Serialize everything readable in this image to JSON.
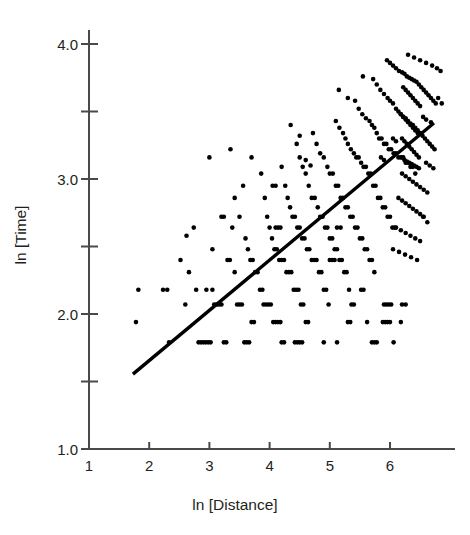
{
  "figure": {
    "background_color": "#ffffff",
    "ink_color": "#231f20",
    "point_color": "#000000",
    "line_color": "#000000"
  },
  "chart_data": {
    "type": "scatter",
    "title": "",
    "xlabel": "ln [Distance]",
    "ylabel": "ln [Time]",
    "xlim": [
      1.0,
      6.95
    ],
    "ylim": [
      1.0,
      4.05
    ],
    "xticks": [
      1,
      2,
      3,
      4,
      5,
      6
    ],
    "xtick_labels": [
      "1",
      "2",
      "3",
      "4",
      "5",
      "6"
    ],
    "yticks": [
      1.0,
      1.5,
      2.0,
      2.5,
      3.0,
      3.5,
      4.0
    ],
    "ytick_labels": [
      "1.0",
      "",
      "2.0",
      "",
      "3.0",
      "",
      "4.0"
    ],
    "ytick_minor": [
      1.5,
      2.5,
      3.5
    ],
    "grid": false,
    "legend": null,
    "marker": "circle",
    "marker_size_px": 4.6,
    "trendline": {
      "label": "",
      "x": [
        1.73,
        6.73
      ],
      "y": [
        1.555,
        3.415
      ],
      "slope": 0.372,
      "intercept": 0.912,
      "width_px": 3.4
    },
    "points": [
      [
        1.78,
        1.94
      ],
      [
        1.82,
        2.18
      ],
      [
        2.23,
        2.18
      ],
      [
        2.3,
        2.18
      ],
      [
        2.33,
        1.79
      ],
      [
        2.52,
        2.4
      ],
      [
        2.6,
        2.07
      ],
      [
        2.62,
        2.58
      ],
      [
        2.66,
        2.31
      ],
      [
        2.74,
        2.64
      ],
      [
        2.78,
        2.18
      ],
      [
        2.82,
        1.79
      ],
      [
        2.86,
        1.79
      ],
      [
        2.9,
        1.79
      ],
      [
        2.94,
        1.79
      ],
      [
        2.98,
        1.79
      ],
      [
        3.02,
        1.79
      ],
      [
        3.0,
        3.16
      ],
      [
        3.05,
        2.48
      ],
      [
        3.08,
        2.07
      ],
      [
        3.12,
        2.07
      ],
      [
        3.16,
        2.07
      ],
      [
        3.2,
        2.07
      ],
      [
        3.24,
        1.79
      ],
      [
        3.28,
        1.79
      ],
      [
        3.3,
        2.4
      ],
      [
        3.34,
        2.4
      ],
      [
        3.38,
        2.64
      ],
      [
        3.42,
        2.31
      ],
      [
        3.46,
        2.07
      ],
      [
        3.5,
        2.07
      ],
      [
        3.54,
        2.07
      ],
      [
        3.58,
        1.79
      ],
      [
        3.62,
        1.79
      ],
      [
        3.66,
        1.79
      ],
      [
        3.7,
        1.94
      ],
      [
        3.74,
        1.94
      ],
      [
        3.42,
        2.86
      ],
      [
        3.5,
        2.72
      ],
      [
        3.56,
        2.95
      ],
      [
        3.6,
        2.56
      ],
      [
        3.64,
        2.48
      ],
      [
        3.68,
        2.4
      ],
      [
        3.72,
        2.4
      ],
      [
        3.76,
        2.31
      ],
      [
        3.8,
        2.31
      ],
      [
        3.84,
        2.18
      ],
      [
        3.88,
        2.18
      ],
      [
        3.9,
        2.07
      ],
      [
        3.94,
        2.07
      ],
      [
        3.98,
        2.07
      ],
      [
        4.02,
        2.07
      ],
      [
        4.06,
        1.94
      ],
      [
        4.1,
        1.94
      ],
      [
        4.14,
        1.94
      ],
      [
        4.18,
        1.94
      ],
      [
        3.86,
        3.04
      ],
      [
        3.92,
        2.86
      ],
      [
        3.96,
        2.72
      ],
      [
        4.0,
        2.64
      ],
      [
        4.04,
        2.56
      ],
      [
        4.08,
        2.48
      ],
      [
        4.12,
        2.48
      ],
      [
        4.16,
        2.4
      ],
      [
        4.2,
        2.4
      ],
      [
        4.24,
        2.4
      ],
      [
        4.28,
        2.31
      ],
      [
        4.32,
        2.31
      ],
      [
        4.36,
        2.31
      ],
      [
        4.4,
        2.18
      ],
      [
        4.44,
        2.18
      ],
      [
        4.48,
        2.18
      ],
      [
        4.52,
        2.07
      ],
      [
        4.56,
        2.07
      ],
      [
        4.6,
        1.94
      ],
      [
        4.64,
        1.94
      ],
      [
        4.2,
        3.09
      ],
      [
        4.26,
        2.95
      ],
      [
        4.3,
        2.86
      ],
      [
        4.34,
        2.79
      ],
      [
        4.38,
        2.72
      ],
      [
        4.42,
        2.72
      ],
      [
        4.46,
        2.64
      ],
      [
        4.5,
        2.64
      ],
      [
        4.54,
        2.56
      ],
      [
        4.58,
        2.56
      ],
      [
        4.62,
        2.48
      ],
      [
        4.66,
        2.48
      ],
      [
        4.7,
        2.4
      ],
      [
        4.74,
        2.4
      ],
      [
        4.78,
        2.4
      ],
      [
        4.82,
        2.31
      ],
      [
        4.86,
        2.31
      ],
      [
        4.9,
        2.18
      ],
      [
        4.94,
        2.18
      ],
      [
        4.98,
        2.07
      ],
      [
        4.45,
        3.26
      ],
      [
        4.5,
        3.16
      ],
      [
        4.55,
        3.09
      ],
      [
        4.6,
        3.04
      ],
      [
        4.65,
        2.95
      ],
      [
        4.7,
        2.86
      ],
      [
        4.75,
        2.86
      ],
      [
        4.8,
        2.79
      ],
      [
        4.84,
        2.72
      ],
      [
        4.88,
        2.72
      ],
      [
        4.92,
        2.64
      ],
      [
        4.96,
        2.64
      ],
      [
        5.0,
        2.56
      ],
      [
        5.04,
        2.56
      ],
      [
        5.08,
        2.48
      ],
      [
        5.12,
        2.48
      ],
      [
        5.16,
        2.4
      ],
      [
        5.2,
        2.4
      ],
      [
        5.24,
        2.31
      ],
      [
        5.28,
        2.31
      ],
      [
        5.32,
        2.18
      ],
      [
        5.36,
        2.07
      ],
      [
        5.4,
        2.07
      ],
      [
        4.72,
        3.34
      ],
      [
        4.78,
        3.26
      ],
      [
        4.84,
        3.19
      ],
      [
        4.9,
        3.16
      ],
      [
        4.96,
        3.09
      ],
      [
        5.0,
        3.04
      ],
      [
        5.05,
        3.04
      ],
      [
        5.1,
        2.95
      ],
      [
        5.14,
        2.95
      ],
      [
        5.18,
        2.86
      ],
      [
        5.22,
        2.86
      ],
      [
        5.26,
        2.79
      ],
      [
        5.3,
        2.79
      ],
      [
        5.34,
        2.72
      ],
      [
        5.38,
        2.72
      ],
      [
        5.42,
        2.64
      ],
      [
        5.46,
        2.64
      ],
      [
        5.5,
        2.56
      ],
      [
        5.54,
        2.56
      ],
      [
        5.58,
        2.48
      ],
      [
        5.62,
        2.48
      ],
      [
        5.66,
        2.4
      ],
      [
        5.7,
        2.4
      ],
      [
        5.74,
        2.31
      ],
      [
        5.1,
        3.43
      ],
      [
        5.16,
        3.38
      ],
      [
        5.22,
        3.34
      ],
      [
        5.26,
        3.3
      ],
      [
        5.3,
        3.26
      ],
      [
        5.35,
        3.22
      ],
      [
        5.4,
        3.19
      ],
      [
        5.44,
        3.16
      ],
      [
        5.48,
        3.16
      ],
      [
        5.52,
        3.12
      ],
      [
        5.56,
        3.09
      ],
      [
        5.6,
        3.09
      ],
      [
        5.64,
        3.04
      ],
      [
        5.68,
        3.04
      ],
      [
        5.72,
        2.95
      ],
      [
        5.76,
        2.95
      ],
      [
        5.8,
        2.86
      ],
      [
        5.84,
        2.86
      ],
      [
        5.88,
        2.79
      ],
      [
        5.92,
        2.79
      ],
      [
        5.96,
        2.72
      ],
      [
        6.0,
        2.72
      ],
      [
        6.04,
        2.64
      ],
      [
        6.08,
        2.64
      ],
      [
        5.42,
        3.58
      ],
      [
        5.48,
        3.52
      ],
      [
        5.54,
        3.48
      ],
      [
        5.6,
        3.45
      ],
      [
        5.66,
        3.43
      ],
      [
        5.7,
        3.4
      ],
      [
        5.74,
        3.38
      ],
      [
        5.78,
        3.34
      ],
      [
        5.82,
        3.3
      ],
      [
        5.86,
        3.3
      ],
      [
        5.9,
        3.26
      ],
      [
        5.94,
        3.26
      ],
      [
        5.98,
        3.22
      ],
      [
        6.02,
        3.22
      ],
      [
        6.06,
        3.19
      ],
      [
        6.1,
        3.19
      ],
      [
        6.14,
        3.16
      ],
      [
        6.18,
        3.16
      ],
      [
        6.22,
        3.16
      ],
      [
        6.26,
        3.12
      ],
      [
        6.3,
        3.12
      ],
      [
        6.34,
        3.09
      ],
      [
        6.38,
        3.09
      ],
      [
        6.42,
        3.04
      ],
      [
        5.72,
        3.74
      ],
      [
        5.78,
        3.7
      ],
      [
        5.84,
        3.66
      ],
      [
        5.9,
        3.63
      ],
      [
        5.96,
        3.6
      ],
      [
        6.0,
        3.58
      ],
      [
        6.05,
        3.56
      ],
      [
        6.1,
        3.52
      ],
      [
        6.14,
        3.5
      ],
      [
        6.18,
        3.48
      ],
      [
        6.22,
        3.46
      ],
      [
        6.26,
        3.45
      ],
      [
        6.3,
        3.43
      ],
      [
        6.34,
        3.41
      ],
      [
        6.38,
        3.4
      ],
      [
        6.42,
        3.38
      ],
      [
        6.46,
        3.36
      ],
      [
        6.5,
        3.34
      ],
      [
        6.54,
        3.32
      ],
      [
        6.58,
        3.3
      ],
      [
        6.62,
        3.28
      ],
      [
        6.66,
        3.26
      ],
      [
        6.7,
        3.24
      ],
      [
        6.74,
        3.22
      ],
      [
        5.95,
        3.88
      ],
      [
        6.0,
        3.86
      ],
      [
        6.05,
        3.84
      ],
      [
        6.1,
        3.82
      ],
      [
        6.15,
        3.8
      ],
      [
        6.2,
        3.79
      ],
      [
        6.24,
        3.78
      ],
      [
        6.28,
        3.76
      ],
      [
        6.32,
        3.75
      ],
      [
        6.36,
        3.74
      ],
      [
        6.4,
        3.73
      ],
      [
        6.44,
        3.72
      ],
      [
        6.48,
        3.7
      ],
      [
        6.52,
        3.68
      ],
      [
        6.56,
        3.66
      ],
      [
        6.6,
        3.64
      ],
      [
        6.64,
        3.62
      ],
      [
        6.68,
        3.6
      ],
      [
        6.72,
        3.58
      ],
      [
        6.76,
        3.56
      ],
      [
        6.3,
        3.92
      ],
      [
        6.4,
        3.9
      ],
      [
        6.5,
        3.88
      ],
      [
        6.6,
        3.86
      ],
      [
        6.7,
        3.84
      ],
      [
        6.78,
        3.82
      ],
      [
        6.84,
        3.8
      ],
      [
        6.22,
        3.68
      ],
      [
        6.26,
        3.66
      ],
      [
        6.3,
        3.64
      ],
      [
        6.34,
        3.62
      ],
      [
        6.38,
        3.6
      ],
      [
        6.42,
        3.58
      ],
      [
        6.46,
        3.56
      ],
      [
        6.5,
        3.54
      ],
      [
        6.18,
        3.48
      ],
      [
        6.22,
        3.46
      ],
      [
        6.26,
        3.44
      ],
      [
        6.3,
        3.42
      ],
      [
        6.34,
        3.4
      ],
      [
        6.38,
        3.38
      ],
      [
        6.42,
        3.36
      ],
      [
        6.46,
        3.34
      ],
      [
        6.2,
        3.3
      ],
      [
        6.24,
        3.28
      ],
      [
        6.28,
        3.26
      ],
      [
        6.32,
        3.24
      ],
      [
        6.36,
        3.22
      ],
      [
        6.4,
        3.2
      ],
      [
        6.44,
        3.18
      ],
      [
        6.48,
        3.16
      ],
      [
        6.2,
        3.16
      ],
      [
        6.24,
        3.14
      ],
      [
        6.28,
        3.13
      ],
      [
        6.32,
        3.12
      ],
      [
        6.36,
        3.11
      ],
      [
        6.4,
        3.1
      ],
      [
        6.44,
        3.09
      ],
      [
        6.48,
        3.08
      ],
      [
        6.2,
        3.04
      ],
      [
        6.26,
        3.02
      ],
      [
        6.32,
        3.0
      ],
      [
        6.38,
        2.98
      ],
      [
        6.44,
        2.96
      ],
      [
        6.5,
        2.94
      ],
      [
        6.56,
        2.92
      ],
      [
        6.62,
        2.9
      ],
      [
        6.14,
        2.86
      ],
      [
        6.2,
        2.84
      ],
      [
        6.26,
        2.82
      ],
      [
        6.32,
        2.8
      ],
      [
        6.38,
        2.78
      ],
      [
        6.44,
        2.76
      ],
      [
        6.5,
        2.74
      ],
      [
        6.56,
        2.72
      ],
      [
        6.1,
        2.64
      ],
      [
        6.18,
        2.62
      ],
      [
        6.26,
        2.6
      ],
      [
        6.34,
        2.58
      ],
      [
        6.42,
        2.56
      ],
      [
        6.5,
        2.54
      ],
      [
        6.05,
        2.48
      ],
      [
        6.15,
        2.46
      ],
      [
        6.25,
        2.44
      ],
      [
        6.35,
        2.42
      ],
      [
        6.45,
        2.4
      ],
      [
        5.52,
        2.18
      ],
      [
        5.56,
        2.18
      ],
      [
        5.9,
        2.07
      ],
      [
        5.94,
        2.07
      ],
      [
        5.98,
        2.07
      ],
      [
        6.02,
        2.07
      ],
      [
        6.2,
        2.07
      ],
      [
        6.26,
        2.07
      ],
      [
        5.3,
        1.94
      ],
      [
        5.34,
        1.94
      ],
      [
        5.62,
        1.94
      ],
      [
        5.88,
        1.94
      ],
      [
        5.92,
        1.94
      ],
      [
        5.96,
        1.94
      ],
      [
        6.0,
        1.94
      ],
      [
        6.18,
        1.94
      ],
      [
        4.9,
        1.79
      ],
      [
        5.12,
        1.79
      ],
      [
        5.7,
        1.79
      ],
      [
        5.74,
        1.79
      ],
      [
        5.78,
        1.79
      ],
      [
        6.06,
        1.79
      ],
      [
        4.42,
        1.79
      ],
      [
        4.46,
        1.79
      ],
      [
        4.5,
        1.79
      ],
      [
        4.54,
        1.79
      ],
      [
        4.2,
        1.79
      ],
      [
        4.24,
        1.79
      ],
      [
        5.0,
        2.4
      ],
      [
        5.04,
        2.4
      ],
      [
        5.08,
        2.4
      ],
      [
        4.1,
        2.64
      ],
      [
        4.14,
        2.64
      ],
      [
        4.18,
        2.64
      ],
      [
        3.35,
        3.22
      ],
      [
        3.7,
        3.16
      ],
      [
        4.35,
        3.4
      ],
      [
        4.5,
        3.32
      ],
      [
        5.15,
        3.66
      ],
      [
        5.3,
        3.6
      ],
      [
        5.55,
        3.76
      ],
      [
        5.12,
        2.64
      ],
      [
        5.18,
        2.64
      ],
      [
        2.95,
        2.18
      ],
      [
        3.05,
        2.18
      ],
      [
        4.05,
        2.95
      ],
      [
        4.1,
        2.95
      ],
      [
        3.2,
        2.72
      ],
      [
        3.24,
        2.72
      ],
      [
        4.6,
        3.14
      ],
      [
        4.68,
        3.1
      ],
      [
        6.6,
        3.12
      ],
      [
        6.66,
        3.1
      ],
      [
        6.72,
        3.08
      ],
      [
        6.55,
        2.72
      ],
      [
        6.62,
        2.68
      ],
      [
        6.55,
        3.46
      ],
      [
        6.6,
        3.44
      ],
      [
        6.68,
        3.42
      ],
      [
        6.8,
        3.6
      ],
      [
        6.86,
        3.56
      ],
      [
        6.05,
        3.3
      ],
      [
        6.1,
        3.28
      ],
      [
        5.85,
        3.16
      ],
      [
        5.9,
        3.14
      ]
    ]
  }
}
